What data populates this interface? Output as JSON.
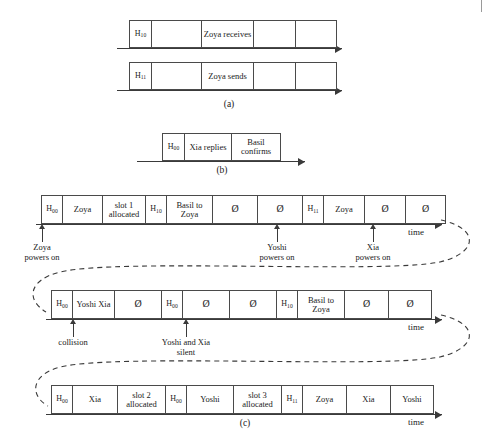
{
  "figure": {
    "edge_mark": "scan-edge-mark",
    "time_axis_label": "time"
  },
  "panel_a": {
    "caption": "(a)",
    "rows": [
      {
        "name": "zoya-receives-frame",
        "cells": [
          {
            "kind": "header",
            "text": "H",
            "sub": "10"
          },
          {
            "kind": "empty",
            "text": ""
          },
          {
            "kind": "label",
            "text": "Zoya receives"
          },
          {
            "kind": "empty",
            "text": ""
          },
          {
            "kind": "empty",
            "text": ""
          }
        ]
      },
      {
        "name": "zoya-sends-frame",
        "cells": [
          {
            "kind": "header",
            "text": "H",
            "sub": "11"
          },
          {
            "kind": "empty",
            "text": ""
          },
          {
            "kind": "label",
            "text": "Zoya sends"
          },
          {
            "kind": "empty",
            "text": ""
          },
          {
            "kind": "empty",
            "text": ""
          }
        ]
      }
    ]
  },
  "panel_b": {
    "caption": "(b)",
    "rows": [
      {
        "name": "xia-basil-frame",
        "cells": [
          {
            "kind": "header",
            "text": "H",
            "sub": "00"
          },
          {
            "kind": "label",
            "text": "Xia replies"
          },
          {
            "kind": "label",
            "text": "Basil confirms"
          }
        ]
      }
    ]
  },
  "panel_c": {
    "caption": "(c)",
    "rows": [
      {
        "name": "timeline-row-1",
        "cells": [
          {
            "kind": "header",
            "text": "H",
            "sub": "00"
          },
          {
            "kind": "label",
            "text": "Zoya"
          },
          {
            "kind": "label",
            "text": "slot 1 allocated"
          },
          {
            "kind": "header",
            "text": "H",
            "sub": "10"
          },
          {
            "kind": "label",
            "text": "Basil to Zoya"
          },
          {
            "kind": "null",
            "text": "Ø"
          },
          {
            "kind": "null",
            "text": "Ø"
          },
          {
            "kind": "header",
            "text": "H",
            "sub": "11"
          },
          {
            "kind": "label",
            "text": "Zoya"
          },
          {
            "kind": "null",
            "text": "Ø"
          },
          {
            "kind": "null",
            "text": "Ø"
          }
        ],
        "annotations": [
          {
            "name": "annotation-zoya-powers-on",
            "line1": "Zoya",
            "line2": "powers on"
          },
          {
            "name": "annotation-yoshi-powers-on",
            "line1": "Yoshi",
            "line2": "powers on"
          },
          {
            "name": "annotation-xia-powers-on",
            "line1": "Xia",
            "line2": "powers on"
          }
        ]
      },
      {
        "name": "timeline-row-2",
        "cells": [
          {
            "kind": "header",
            "text": "H",
            "sub": "00"
          },
          {
            "kind": "label",
            "text": "Yoshi Xia"
          },
          {
            "kind": "null",
            "text": "Ø"
          },
          {
            "kind": "header",
            "text": "H",
            "sub": "00"
          },
          {
            "kind": "null",
            "text": "Ø"
          },
          {
            "kind": "null",
            "text": "Ø"
          },
          {
            "kind": "header",
            "text": "H",
            "sub": "10"
          },
          {
            "kind": "label",
            "text": "Basil to Zoya"
          },
          {
            "kind": "null",
            "text": "Ø"
          },
          {
            "kind": "null",
            "text": "Ø"
          }
        ],
        "annotations": [
          {
            "name": "annotation-collision",
            "line1": "collision",
            "line2": ""
          },
          {
            "name": "annotation-yoshi-xia-silent",
            "line1": "Yoshi and Xia",
            "line2": "silent"
          }
        ]
      },
      {
        "name": "timeline-row-3",
        "cells": [
          {
            "kind": "header",
            "text": "H",
            "sub": "00"
          },
          {
            "kind": "label",
            "text": "Xia"
          },
          {
            "kind": "label",
            "text": "slot 2 allocated"
          },
          {
            "kind": "header",
            "text": "H",
            "sub": "00"
          },
          {
            "kind": "label",
            "text": "Yoshi"
          },
          {
            "kind": "label",
            "text": "slot 3 allocated"
          },
          {
            "kind": "header",
            "text": "H",
            "sub": "11"
          },
          {
            "kind": "label",
            "text": "Zoya"
          },
          {
            "kind": "label",
            "text": "Xia"
          },
          {
            "kind": "label",
            "text": "Yoshi"
          }
        ],
        "annotations": []
      }
    ]
  }
}
